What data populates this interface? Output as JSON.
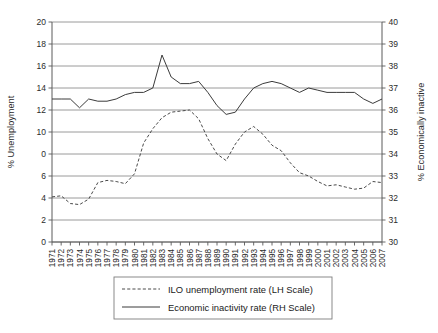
{
  "chart_data": {
    "type": "line",
    "title": "",
    "grid": true,
    "legend_position": "bottom-center",
    "x": [
      "1971",
      "1972",
      "1973",
      "1974",
      "1975",
      "1976",
      "1977",
      "1978",
      "1979",
      "1980",
      "1981",
      "1982",
      "1983",
      "1984",
      "1985",
      "1986",
      "1987",
      "1988",
      "1989",
      "1990",
      "1991",
      "1992",
      "1993",
      "1994",
      "1995",
      "1996",
      "1997",
      "1998",
      "1999",
      "2000",
      "2001",
      "2002",
      "2003",
      "2004",
      "2005",
      "2006",
      "2007"
    ],
    "xlabel": "",
    "left_axis": {
      "label": "% Unemployment",
      "ylim": [
        0,
        20
      ],
      "ticks": [
        "0",
        "2",
        "4",
        "6",
        "0",
        "10",
        "12",
        "14",
        "16",
        "18",
        "20"
      ],
      "tick_values": [
        0,
        2,
        4,
        6,
        8,
        10,
        12,
        14,
        16,
        18,
        20
      ]
    },
    "right_axis": {
      "label": "% Economically inactive",
      "ylim": [
        30,
        40
      ],
      "ticks": [
        "30",
        "31",
        "32",
        "33",
        "34",
        "35",
        "36",
        "37",
        "38",
        "39",
        "40"
      ],
      "tick_values": [
        30,
        31,
        32,
        33,
        34,
        35,
        36,
        37,
        38,
        39,
        40
      ]
    },
    "series": [
      {
        "name": "ILO unemployment rate (LH Scale)",
        "legend_label": "ILO unemployment rate (LH Scale)",
        "axis": "left",
        "style": "dashed",
        "color": "#4a4a4a",
        "values": [
          4.1,
          4.2,
          3.5,
          3.4,
          3.9,
          5.4,
          5.6,
          5.5,
          5.3,
          6.2,
          9.0,
          10.3,
          11.3,
          11.8,
          11.9,
          12.0,
          11.2,
          9.4,
          8.0,
          7.4,
          8.9,
          10.0,
          10.5,
          9.8,
          8.8,
          8.3,
          7.2,
          6.3,
          6.0,
          5.5,
          5.1,
          5.2,
          5.0,
          4.8,
          4.9,
          5.5,
          5.4
        ]
      },
      {
        "name": "Economic inactivity rate (RH Scale)",
        "legend_label": "Economic inactivity rate (RH Scale)",
        "axis": "right",
        "style": "solid",
        "color": "#3b3b3b",
        "values": [
          36.5,
          36.5,
          36.5,
          36.1,
          36.5,
          36.4,
          36.4,
          36.5,
          36.7,
          36.8,
          36.8,
          37.0,
          38.5,
          37.5,
          37.2,
          37.2,
          37.3,
          36.8,
          36.2,
          35.8,
          35.9,
          36.5,
          37.0,
          37.2,
          37.3,
          37.2,
          37.0,
          36.8,
          37.0,
          36.9,
          36.8,
          36.8,
          36.8,
          36.8,
          36.5,
          36.3,
          36.5
        ]
      }
    ]
  },
  "plot_area": {
    "x0": 52,
    "y0": 22,
    "x1": 382,
    "y1": 242
  }
}
